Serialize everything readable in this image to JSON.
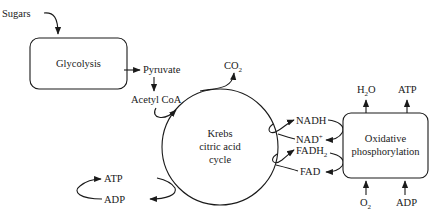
{
  "diagram": {
    "colors": {
      "ink": "#1a1a1a",
      "background": "#ffffff"
    },
    "inputs": {
      "sugars": "Sugars"
    },
    "glycolysis": {
      "label": "Glycolysis"
    },
    "pyruvate": "Pyruvate",
    "acetyl_coa": "Acetyl CoA",
    "co2": {
      "base": "CO",
      "sub": "2"
    },
    "krebs": {
      "line1": "Krebs",
      "line2": "citric acid",
      "line3": "cycle"
    },
    "krebs_atp": {
      "atp": "ATP",
      "adp": "ADP"
    },
    "carriers": {
      "nadh": "NADH",
      "nad": {
        "base": "NAD",
        "sup": "+"
      },
      "fadh2": {
        "base": "FADH",
        "sub": "2"
      },
      "fad": "FAD"
    },
    "oxphos": {
      "line1": "Oxidative",
      "line2": "phosphorylation",
      "outputs": {
        "h2o": {
          "pre": "H",
          "sub": "2",
          "post": "O"
        },
        "atp": "ATP"
      },
      "inputs": {
        "o2": {
          "base": "O",
          "sub": "2"
        },
        "adp": "ADP"
      }
    }
  }
}
